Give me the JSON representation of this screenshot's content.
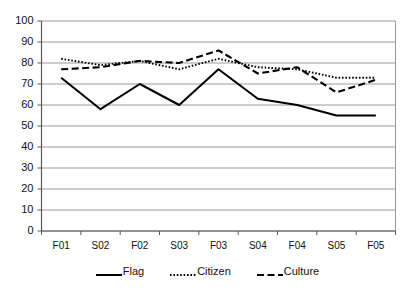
{
  "chart_data": {
    "type": "line",
    "title": "",
    "xlabel": "",
    "ylabel": "",
    "categories": [
      "F01",
      "S02",
      "F02",
      "S03",
      "F03",
      "S04",
      "F04",
      "S05",
      "F05"
    ],
    "ylim": [
      0,
      100
    ],
    "ytick_labels": [
      "100",
      "90",
      "80",
      "70",
      "60",
      "50",
      "40",
      "30",
      "20",
      "10",
      "0"
    ],
    "ytick_values": [
      100,
      90,
      80,
      70,
      60,
      50,
      40,
      30,
      20,
      10,
      0
    ],
    "grid": true,
    "legend_position": "bottom",
    "series": [
      {
        "name": "Flag",
        "style": "solid",
        "color": "#000000",
        "values": [
          73,
          58,
          70,
          60,
          77,
          63,
          60,
          55,
          55
        ]
      },
      {
        "name": "Citizen",
        "style": "dotted",
        "color": "#000000",
        "values": [
          82,
          79,
          81,
          77,
          82,
          78,
          77,
          73,
          73
        ]
      },
      {
        "name": "Culture",
        "style": "dashed",
        "color": "#000000",
        "values": [
          77,
          78,
          81,
          80,
          86,
          75,
          78,
          66,
          72
        ]
      }
    ]
  },
  "legend": {
    "items": [
      {
        "label": "Flag",
        "icon": "solid-line-swatch"
      },
      {
        "label": "Citizen",
        "icon": "dotted-line-swatch"
      },
      {
        "label": "Culture",
        "icon": "dashed-line-swatch"
      }
    ]
  },
  "axes": {
    "y_axis_name": "value-axis",
    "x_axis_name": "category-axis"
  }
}
